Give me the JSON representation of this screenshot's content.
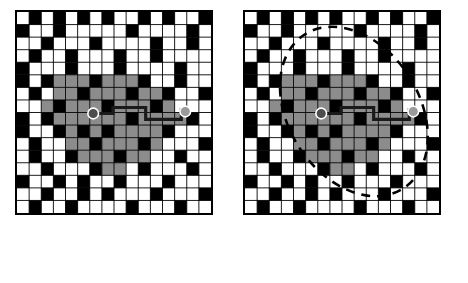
{
  "figure": {
    "title": "",
    "panels": [
      {
        "id": "left",
        "name": "path-grid-without-search-zone"
      },
      {
        "id": "right",
        "name": "path-grid-with-search-zone"
      }
    ]
  },
  "legend": {
    "items": [
      {
        "key": "start",
        "marker": "filled-circle-dark",
        "color": "#4d4d4d",
        "line1": "Starting",
        "line2": "Node"
      },
      {
        "key": "end",
        "marker": "filled-circle-gray",
        "color": "#9a9a9a",
        "line1": "Ending",
        "line2": "Node"
      },
      {
        "key": "path",
        "marker": "solid-line",
        "color": "#1a1a1a",
        "line1": "Path",
        "line2": ""
      },
      {
        "key": "zone",
        "marker": "dashed-ellipse",
        "color": "#000000",
        "line1": "Searching",
        "line2": "Zone"
      }
    ]
  },
  "grid": {
    "cols": 16,
    "rows": 16,
    "cell": 12.2,
    "colors": {
      "free": "#ffffff",
      "obstacle": "#000000",
      "visited": "#8c8c8c",
      "gridline": "#000000",
      "start_node": "#4d4d4d",
      "end_node": "#9a9a9a",
      "path": "#1a1a1a",
      "zone": "#000000"
    },
    "obstacles": [
      [
        0,
        1
      ],
      [
        0,
        4
      ],
      [
        0,
        5
      ],
      [
        0,
        8
      ],
      [
        0,
        9
      ],
      [
        0,
        13
      ],
      [
        1,
        0
      ],
      [
        1,
        3
      ],
      [
        1,
        6
      ],
      [
        1,
        10
      ],
      [
        1,
        11
      ],
      [
        1,
        15
      ],
      [
        2,
        2
      ],
      [
        2,
        5
      ],
      [
        2,
        8
      ],
      [
        2,
        12
      ],
      [
        2,
        14
      ],
      [
        3,
        0
      ],
      [
        3,
        1
      ],
      [
        3,
        7
      ],
      [
        3,
        9
      ],
      [
        3,
        13
      ],
      [
        4,
        3
      ],
      [
        4,
        4
      ],
      [
        4,
        11
      ],
      [
        4,
        15
      ],
      [
        5,
        0
      ],
      [
        5,
        6
      ],
      [
        5,
        9
      ],
      [
        5,
        13
      ],
      [
        5,
        14
      ],
      [
        6,
        2
      ],
      [
        6,
        5
      ],
      [
        6,
        10
      ],
      [
        6,
        12
      ],
      [
        7,
        0
      ],
      [
        7,
        7
      ],
      [
        7,
        9
      ],
      [
        7,
        14
      ],
      [
        8,
        3
      ],
      [
        8,
        4
      ],
      [
        8,
        11
      ],
      [
        8,
        13
      ],
      [
        9,
        1
      ],
      [
        9,
        6
      ],
      [
        9,
        8
      ],
      [
        9,
        15
      ],
      [
        10,
        0
      ],
      [
        10,
        5
      ],
      [
        10,
        10
      ],
      [
        10,
        12
      ],
      [
        11,
        2
      ],
      [
        11,
        3
      ],
      [
        11,
        7
      ],
      [
        11,
        14
      ],
      [
        12,
        0
      ],
      [
        12,
        6
      ],
      [
        12,
        9
      ],
      [
        12,
        13
      ],
      [
        13,
        4
      ],
      [
        13,
        5
      ],
      [
        13,
        11
      ],
      [
        13,
        15
      ],
      [
        14,
        1
      ],
      [
        14,
        2
      ],
      [
        14,
        8
      ],
      [
        14,
        12
      ],
      [
        15,
        0
      ],
      [
        15,
        6
      ],
      [
        15,
        10
      ],
      [
        15,
        14
      ]
    ],
    "visited_region": [
      [
        3,
        5
      ],
      [
        4,
        5
      ],
      [
        5,
        5
      ],
      [
        6,
        5
      ],
      [
        7,
        5
      ],
      [
        8,
        5
      ],
      [
        9,
        5
      ],
      [
        10,
        5
      ],
      [
        3,
        6
      ],
      [
        4,
        6
      ],
      [
        5,
        6
      ],
      [
        6,
        6
      ],
      [
        7,
        6
      ],
      [
        8,
        6
      ],
      [
        9,
        6
      ],
      [
        10,
        6
      ],
      [
        11,
        6
      ],
      [
        2,
        7
      ],
      [
        3,
        7
      ],
      [
        4,
        7
      ],
      [
        5,
        7
      ],
      [
        6,
        7
      ],
      [
        7,
        7
      ],
      [
        8,
        7
      ],
      [
        9,
        7
      ],
      [
        10,
        7
      ],
      [
        11,
        7
      ],
      [
        12,
        7
      ],
      [
        2,
        8
      ],
      [
        3,
        8
      ],
      [
        4,
        8
      ],
      [
        5,
        8
      ],
      [
        6,
        8
      ],
      [
        7,
        8
      ],
      [
        8,
        8
      ],
      [
        9,
        8
      ],
      [
        10,
        8
      ],
      [
        11,
        8
      ],
      [
        12,
        8
      ],
      [
        13,
        8
      ],
      [
        3,
        9
      ],
      [
        4,
        9
      ],
      [
        5,
        9
      ],
      [
        6,
        9
      ],
      [
        7,
        9
      ],
      [
        8,
        9
      ],
      [
        9,
        9
      ],
      [
        10,
        9
      ],
      [
        11,
        9
      ],
      [
        12,
        9
      ],
      [
        4,
        10
      ],
      [
        5,
        10
      ],
      [
        6,
        10
      ],
      [
        7,
        10
      ],
      [
        8,
        10
      ],
      [
        9,
        10
      ],
      [
        10,
        10
      ],
      [
        11,
        10
      ],
      [
        5,
        11
      ],
      [
        6,
        11
      ],
      [
        7,
        11
      ],
      [
        8,
        11
      ],
      [
        9,
        11
      ],
      [
        10,
        11
      ],
      [
        6,
        12
      ],
      [
        7,
        12
      ],
      [
        8,
        12
      ]
    ],
    "start_node": {
      "col": 6,
      "row": 8
    },
    "end_node": {
      "col": 13,
      "row": 8
    }
  }
}
